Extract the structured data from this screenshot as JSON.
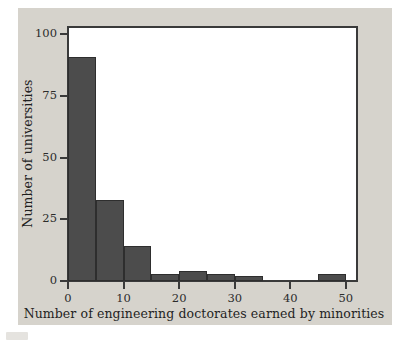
{
  "chart_data": {
    "type": "bar",
    "chart_subtype": "histogram",
    "title": "",
    "xlabel": "Number of engineering doctorates earned by minorities",
    "ylabel": "Number of universities",
    "xlim": [
      0,
      52
    ],
    "ylim": [
      0,
      103
    ],
    "grid": false,
    "legend": null,
    "bin_width": 5,
    "bin_edges": [
      0,
      5,
      10,
      15,
      20,
      25,
      30,
      35,
      40,
      45,
      50
    ],
    "categories": [
      "0-5",
      "5-10",
      "10-15",
      "15-20",
      "20-25",
      "25-30",
      "30-35",
      "35-40",
      "40-45",
      "45-50"
    ],
    "values": [
      91,
      33,
      14,
      3,
      4,
      3,
      2,
      0,
      0,
      3
    ],
    "bars": [
      {
        "label": "0-5",
        "x0": 0,
        "x1": 5,
        "value": 91
      },
      {
        "label": "5-10",
        "x0": 5,
        "x1": 10,
        "value": 33
      },
      {
        "label": "10-15",
        "x0": 10,
        "x1": 15,
        "value": 14
      },
      {
        "label": "15-20",
        "x0": 15,
        "x1": 20,
        "value": 3
      },
      {
        "label": "20-25",
        "x0": 20,
        "x1": 25,
        "value": 4
      },
      {
        "label": "25-30",
        "x0": 25,
        "x1": 30,
        "value": 3
      },
      {
        "label": "30-35",
        "x0": 30,
        "x1": 35,
        "value": 2
      },
      {
        "label": "35-40",
        "x0": 35,
        "x1": 40,
        "value": 0
      },
      {
        "label": "40-45",
        "x0": 40,
        "x1": 45,
        "value": 0
      },
      {
        "label": "45-50",
        "x0": 45,
        "x1": 50,
        "value": 3
      }
    ],
    "xticks": [
      {
        "value": 0,
        "label": "0"
      },
      {
        "value": 10,
        "label": "10"
      },
      {
        "value": 20,
        "label": "20"
      },
      {
        "value": 30,
        "label": "30"
      },
      {
        "value": 40,
        "label": "40"
      },
      {
        "value": 50,
        "label": "50"
      }
    ],
    "yticks": [
      {
        "value": 0,
        "label": "0"
      },
      {
        "value": 25,
        "label": "25"
      },
      {
        "value": 50,
        "label": "50"
      },
      {
        "value": 75,
        "label": "75"
      },
      {
        "value": 100,
        "label": "100"
      }
    ],
    "colors": {
      "bar_fill": "#4c4c4c",
      "bar_edge": "#2e2e2e",
      "figure_background": "#d6d3cc",
      "plot_background": "#ffffff",
      "axis": "#3a3a3a",
      "text": "#1f1f1f"
    }
  }
}
